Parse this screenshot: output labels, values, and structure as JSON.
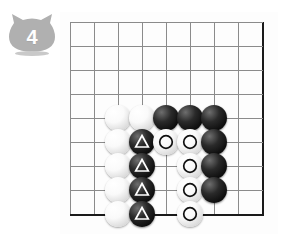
{
  "badge": {
    "icon": "cat-head-badge",
    "number": "4",
    "fill_color": "#b0b0b0",
    "text_color": "#ffffff"
  },
  "board": {
    "type": "go-board",
    "columns": 9,
    "rows": 9,
    "grid_spacing_px": 24,
    "line_color": "#8b8b8b",
    "edge_color": "#1a1a1a",
    "background_color": "#fdfdfd",
    "edges": [
      "right",
      "bottom"
    ],
    "col_x": [
      10,
      34,
      58,
      82,
      106,
      130,
      154,
      178,
      202
    ],
    "row_y": [
      10,
      34,
      58,
      82,
      106,
      130,
      154,
      178,
      202
    ],
    "black_color": "#0b0b0b",
    "white_color": "#f2f2f2",
    "triangle_mark_color": "#ffffff",
    "circle_mark_color": "#111111",
    "stones": [
      {
        "col": 2,
        "row": 4,
        "color": "white",
        "mark": "none"
      },
      {
        "col": 3,
        "row": 4,
        "color": "white",
        "mark": "none"
      },
      {
        "col": 4,
        "row": 4,
        "color": "black",
        "mark": "none"
      },
      {
        "col": 5,
        "row": 4,
        "color": "black",
        "mark": "none"
      },
      {
        "col": 6,
        "row": 4,
        "color": "black",
        "mark": "none"
      },
      {
        "col": 2,
        "row": 5,
        "color": "white",
        "mark": "none"
      },
      {
        "col": 3,
        "row": 5,
        "color": "black",
        "mark": "triangle"
      },
      {
        "col": 4,
        "row": 5,
        "color": "white",
        "mark": "circle"
      },
      {
        "col": 5,
        "row": 5,
        "color": "white",
        "mark": "circle"
      },
      {
        "col": 6,
        "row": 5,
        "color": "black",
        "mark": "none"
      },
      {
        "col": 2,
        "row": 6,
        "color": "white",
        "mark": "none"
      },
      {
        "col": 3,
        "row": 6,
        "color": "black",
        "mark": "triangle"
      },
      {
        "col": 5,
        "row": 6,
        "color": "white",
        "mark": "circle"
      },
      {
        "col": 6,
        "row": 6,
        "color": "black",
        "mark": "none"
      },
      {
        "col": 2,
        "row": 7,
        "color": "white",
        "mark": "none"
      },
      {
        "col": 3,
        "row": 7,
        "color": "black",
        "mark": "triangle"
      },
      {
        "col": 5,
        "row": 7,
        "color": "white",
        "mark": "circle"
      },
      {
        "col": 6,
        "row": 7,
        "color": "black",
        "mark": "none"
      },
      {
        "col": 2,
        "row": 8,
        "color": "white",
        "mark": "none"
      },
      {
        "col": 3,
        "row": 8,
        "color": "black",
        "mark": "triangle"
      },
      {
        "col": 5,
        "row": 8,
        "color": "white",
        "mark": "circle"
      }
    ]
  }
}
